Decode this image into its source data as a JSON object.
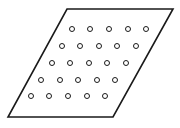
{
  "figure": {
    "type": "geometry-diagram",
    "canvas": {
      "width": 180,
      "height": 128,
      "background": "#ffffff"
    },
    "shape": {
      "name": "parallelogram",
      "stroke_color": "#1a1a1a",
      "stroke_width": 1.6,
      "fill": "#ffffff",
      "vertices": [
        {
          "label": "top-left",
          "x": 67,
          "y": 9
        },
        {
          "label": "top-right",
          "x": 173,
          "y": 9
        },
        {
          "label": "bottom-right",
          "x": 113,
          "y": 117
        },
        {
          "label": "bottom-left",
          "x": 8,
          "y": 117
        }
      ],
      "points_attr": "67,9 173,9 113,117 8,117"
    },
    "dots": {
      "count_total": 25,
      "rows": 5,
      "columns": 5,
      "marker": "ring",
      "outer_radius": 2.5,
      "inner_radius": 1.1,
      "stroke_color": "#1a1a1a",
      "stroke_width": 1.0,
      "inner_fill": "#ffffff",
      "row_spacing_y": 16.8,
      "column_spacing_x": 18.4,
      "row_shift_x": -10.3,
      "positions": [
        [
          {
            "x": 72,
            "y": 29
          },
          {
            "x": 90,
            "y": 29
          },
          {
            "x": 109,
            "y": 29
          },
          {
            "x": 128,
            "y": 29
          },
          {
            "x": 146,
            "y": 29
          }
        ],
        [
          {
            "x": 62,
            "y": 46
          },
          {
            "x": 80,
            "y": 46
          },
          {
            "x": 99,
            "y": 46
          },
          {
            "x": 117,
            "y": 46
          },
          {
            "x": 136,
            "y": 46
          }
        ],
        [
          {
            "x": 52,
            "y": 63
          },
          {
            "x": 70,
            "y": 63
          },
          {
            "x": 89,
            "y": 63
          },
          {
            "x": 107,
            "y": 63
          },
          {
            "x": 126,
            "y": 63
          }
        ],
        [
          {
            "x": 41,
            "y": 80
          },
          {
            "x": 60,
            "y": 80
          },
          {
            "x": 78,
            "y": 80
          },
          {
            "x": 97,
            "y": 80
          },
          {
            "x": 115,
            "y": 80
          }
        ],
        [
          {
            "x": 31,
            "y": 96
          },
          {
            "x": 49,
            "y": 96
          },
          {
            "x": 68,
            "y": 96
          },
          {
            "x": 87,
            "y": 96
          },
          {
            "x": 105,
            "y": 96
          }
        ]
      ]
    }
  }
}
